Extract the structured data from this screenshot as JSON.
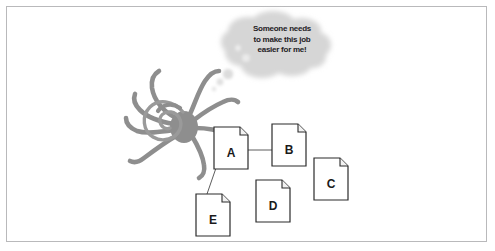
{
  "page": {
    "background_color": "#ffffff",
    "frame_color": "#b9b9bb"
  },
  "thought_bubble": {
    "name": "thought-bubble",
    "fill_color": "#d8d8d8",
    "text_color": "#23201f",
    "lines": [
      "Someone needs",
      "to make this job",
      "easier for me!"
    ],
    "full_text": "Someone needs to make this job easier for me!"
  },
  "spider": {
    "name": "spider-illustration",
    "color": "#8e8e8e",
    "leg_count": 8,
    "head_style": "spiral"
  },
  "documents": [
    {
      "id": "doc-a",
      "label": "A",
      "x": 214,
      "y": 127,
      "w": 34,
      "h": 42
    },
    {
      "id": "doc-b",
      "label": "B",
      "x": 272,
      "y": 124,
      "w": 34,
      "h": 42
    },
    {
      "id": "doc-c",
      "label": "C",
      "x": 314,
      "y": 158,
      "w": 34,
      "h": 42
    },
    {
      "id": "doc-d",
      "label": "D",
      "x": 256,
      "y": 180,
      "w": 34,
      "h": 42
    },
    {
      "id": "doc-e",
      "label": "E",
      "x": 196,
      "y": 194,
      "w": 34,
      "h": 42
    }
  ],
  "connectors": [
    {
      "id": "connector-a-b",
      "from": "A",
      "to": "B"
    },
    {
      "id": "connector-a-e",
      "from": "A",
      "to": "E"
    }
  ],
  "colors": {
    "doc_stroke": "#2b2b2b",
    "doc_fill": "#ffffff",
    "connector": "#5d5d5d",
    "spider": "#8e8e8e",
    "cloud": "#d8d8d8"
  }
}
